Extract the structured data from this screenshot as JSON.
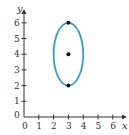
{
  "chart_data": {
    "type": "scatter",
    "title": "",
    "xlabel": "x",
    "ylabel": "y",
    "xlim": [
      0,
      7
    ],
    "ylim": [
      0,
      6.5
    ],
    "x_ticks": [
      "0",
      "1",
      "2",
      "3",
      "4",
      "5",
      "6"
    ],
    "y_ticks": [
      "0",
      "1",
      "2",
      "3",
      "4",
      "5",
      "6"
    ],
    "grid": false,
    "legend": null,
    "points": [
      {
        "x": 3,
        "y": 6,
        "label": "vertex"
      },
      {
        "x": 3,
        "y": 4,
        "label": "center"
      },
      {
        "x": 3,
        "y": 2,
        "label": "vertex"
      }
    ],
    "curve": {
      "shape": "ellipse",
      "center": [
        3,
        4
      ],
      "semi_axis_x": 1,
      "semi_axis_y": 2,
      "color": "#3a9bd5"
    }
  },
  "colors": {
    "curve": "#3a9bd5",
    "axis": "#333333",
    "point": "#111111"
  }
}
